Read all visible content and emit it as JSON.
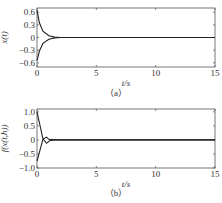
{
  "chart_data": [
    {
      "type": "line",
      "panel": "(a)",
      "caption": "（a）",
      "xlabel": "t/s",
      "ylabel": "x(t)",
      "xlim": [
        0,
        15
      ],
      "ylim": [
        -0.7,
        0.7
      ],
      "xticks": [
        "0",
        "5",
        "10",
        "15"
      ],
      "yticks": [
        "0.6",
        "0.3",
        "0",
        "-0.3",
        "-0.6"
      ],
      "grid": false,
      "series": [
        {
          "name": "upper trajectory",
          "x": [
            0,
            0.2,
            0.5,
            1.0,
            1.5,
            2,
            15
          ],
          "y": [
            0.65,
            0.35,
            0.15,
            0.04,
            0.01,
            0.0,
            0.0
          ]
        },
        {
          "name": "lower trajectory",
          "x": [
            0,
            0.2,
            0.5,
            1.0,
            1.5,
            2,
            15
          ],
          "y": [
            -0.55,
            -0.32,
            -0.14,
            -0.04,
            -0.01,
            0.0,
            0.0
          ]
        }
      ]
    },
    {
      "type": "line",
      "panel": "(b)",
      "caption": "（b）",
      "xlabel": "t/s",
      "ylabel": "f(x(t,h))",
      "xlim": [
        0,
        15
      ],
      "ylim": [
        -1.0,
        1.1
      ],
      "xticks": [
        "0",
        "5",
        "10",
        "15"
      ],
      "yticks": [
        "1.0",
        "0.5",
        "0",
        "-0.5",
        "-1.0"
      ],
      "grid": false,
      "series": [
        {
          "name": "upper response",
          "x": [
            0,
            0.1,
            0.5,
            0.8,
            1.0,
            1.2,
            1.5,
            2,
            15
          ],
          "y": [
            1.0,
            0.8,
            0.05,
            -0.12,
            -0.05,
            0.02,
            0.0,
            0.0,
            0.0
          ]
        },
        {
          "name": "lower response",
          "x": [
            0,
            0.1,
            0.5,
            0.8,
            1.0,
            1.2,
            1.5,
            2,
            15
          ],
          "y": [
            -0.75,
            -0.6,
            0.02,
            0.1,
            0.02,
            -0.02,
            0.0,
            0.0,
            0.0
          ]
        }
      ]
    }
  ]
}
